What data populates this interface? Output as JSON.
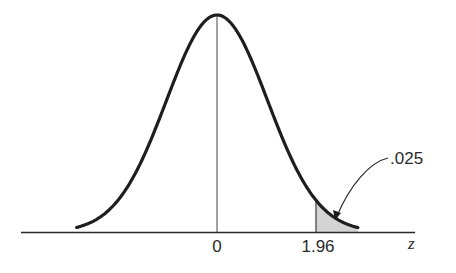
{
  "chart_data": {
    "type": "area",
    "title": "",
    "subtitle": "",
    "distribution": {
      "name": "standard normal",
      "mean": 0,
      "sd": 1
    },
    "xlabel": "z",
    "ylabel": "",
    "x_ticks": [
      {
        "value": 0,
        "label": "0"
      },
      {
        "value": 1.96,
        "label": "1.96"
      }
    ],
    "xlim": [
      -2.78,
      2.79
    ],
    "grid": false,
    "legend": null,
    "shaded_region": {
      "from": 1.96,
      "to": 2.79,
      "area": 0.025,
      "color": "#d4d4d4"
    },
    "annotations": [
      {
        "text": ".025",
        "points_to": "shaded upper tail area",
        "arrow": true
      }
    ],
    "center_line": {
      "x": 0
    }
  },
  "labels": {
    "tick_zero": "0",
    "tick_critical": "1.96",
    "axis_label": "z",
    "tail_area": ".025"
  },
  "colors": {
    "curve": "#1e1e1e",
    "axis": "#2a2a2a",
    "shade": "#d4d4d4",
    "text": "#2a2a2a"
  }
}
